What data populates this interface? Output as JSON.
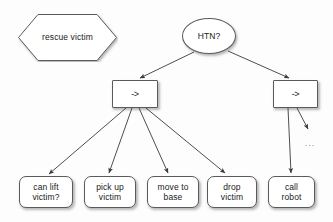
{
  "diagram": {
    "background_color": "#fdfdfd",
    "stroke_color": "#5a5a5a",
    "edge_color": "#4a4a4a",
    "text_color": "#1a1a1a",
    "nodes": [
      {
        "id": "rescue-victim",
        "label": "rescue victim",
        "shape": "hexagon",
        "x": 17,
        "y": 13,
        "w": 101,
        "h": 49
      },
      {
        "id": "htn-question",
        "label": "HTN?",
        "shape": "ellipse",
        "x": 182,
        "y": 18,
        "w": 54,
        "h": 36
      },
      {
        "id": "method-left",
        "label": "->",
        "shape": "rectangle",
        "x": 112,
        "y": 80,
        "w": 46,
        "h": 28
      },
      {
        "id": "method-right",
        "label": "->",
        "shape": "rectangle",
        "x": 273,
        "y": 80,
        "w": 45,
        "h": 28
      },
      {
        "id": "can-lift-victim",
        "label": "can lift\nvictim?",
        "shape": "rounded-rectangle",
        "x": 19,
        "y": 176,
        "w": 54,
        "h": 32
      },
      {
        "id": "pick-up-victim",
        "label": "pick up\nvictim",
        "shape": "rounded-rectangle",
        "x": 84,
        "y": 176,
        "w": 52,
        "h": 32
      },
      {
        "id": "move-to-base",
        "label": "move to\nbase",
        "shape": "rounded-rectangle",
        "x": 147,
        "y": 176,
        "w": 52,
        "h": 32
      },
      {
        "id": "drop-victim",
        "label": "drop\nvictim",
        "shape": "rounded-rectangle",
        "x": 207,
        "y": 176,
        "w": 50,
        "h": 32
      },
      {
        "id": "call-robot",
        "label": "call\nrobot",
        "shape": "rounded-rectangle",
        "x": 268,
        "y": 176,
        "w": 47,
        "h": 32
      },
      {
        "id": "more-ellipsis",
        "label": "...",
        "shape": "text",
        "x": 300,
        "y": 136,
        "w": 20,
        "h": 14
      }
    ],
    "edges": [
      {
        "id": "htn-to-method-left",
        "from": "htn-question",
        "to": "method-left"
      },
      {
        "id": "htn-to-method-right",
        "from": "htn-question",
        "to": "method-right"
      },
      {
        "id": "left-to-can-lift",
        "from": "method-left",
        "to": "can-lift-victim"
      },
      {
        "id": "left-to-pick-up",
        "from": "method-left",
        "to": "pick-up-victim"
      },
      {
        "id": "left-to-move-to",
        "from": "method-left",
        "to": "move-to-base"
      },
      {
        "id": "left-to-drop",
        "from": "method-left",
        "to": "drop-victim"
      },
      {
        "id": "right-to-call-robot",
        "from": "method-right",
        "to": "call-robot"
      },
      {
        "id": "right-to-ellipsis",
        "from": "method-right",
        "to": "more-ellipsis"
      }
    ]
  }
}
